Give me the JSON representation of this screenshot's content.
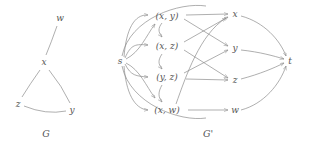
{
  "figure": {
    "title": "",
    "stroke_color": "#8d8d8d",
    "text_color": "#555555",
    "background": "#ffffff"
  },
  "graph_g": {
    "caption": "G",
    "nodes": [
      {
        "id": "w",
        "label": "w",
        "x": 60,
        "y": 18
      },
      {
        "id": "x",
        "label": "x",
        "x": 44,
        "y": 62
      },
      {
        "id": "z",
        "label": "z",
        "x": 18,
        "y": 104
      },
      {
        "id": "y",
        "label": "y",
        "x": 72,
        "y": 110
      }
    ],
    "edges": [
      {
        "from": "w",
        "to": "x"
      },
      {
        "from": "x",
        "to": "z"
      },
      {
        "from": "x",
        "to": "y"
      },
      {
        "from": "z",
        "to": "y"
      }
    ]
  },
  "graph_gprime": {
    "caption": "G'",
    "source": {
      "id": "s",
      "label": "s",
      "x": 120,
      "y": 61
    },
    "sink": {
      "id": "t",
      "label": "t",
      "x": 290,
      "y": 61
    },
    "pair_nodes": [
      {
        "id": "xy",
        "label": "(x, y)",
        "x": 167,
        "y": 16
      },
      {
        "id": "xz",
        "label": "(x, z)",
        "x": 167,
        "y": 46
      },
      {
        "id": "yz",
        "label": "(y, z)",
        "x": 167,
        "y": 77
      },
      {
        "id": "xw",
        "label": "(x, w)",
        "x": 167,
        "y": 110
      }
    ],
    "vertex_nodes": [
      {
        "id": "x",
        "label": "x",
        "x": 235,
        "y": 14
      },
      {
        "id": "y",
        "label": "y",
        "x": 235,
        "y": 48
      },
      {
        "id": "z",
        "label": "z",
        "x": 235,
        "y": 80
      },
      {
        "id": "w",
        "label": "w",
        "x": 235,
        "y": 110
      }
    ],
    "source_edges": [
      {
        "from": "s",
        "to": "xy"
      },
      {
        "from": "s",
        "to": "xz"
      },
      {
        "from": "s",
        "to": "yz"
      },
      {
        "from": "s",
        "to": "xw"
      }
    ],
    "middle_edges": [
      {
        "from": "xy",
        "to": "x"
      },
      {
        "from": "xy",
        "to": "y"
      },
      {
        "from": "xz",
        "to": "x"
      },
      {
        "from": "xz",
        "to": "z"
      },
      {
        "from": "yz",
        "to": "y"
      },
      {
        "from": "yz",
        "to": "z"
      },
      {
        "from": "xw",
        "to": "x"
      },
      {
        "from": "xw",
        "to": "w"
      }
    ],
    "sink_edges": [
      {
        "from": "x",
        "to": "t"
      },
      {
        "from": "y",
        "to": "t"
      },
      {
        "from": "z",
        "to": "t"
      },
      {
        "from": "w",
        "to": "t"
      }
    ]
  }
}
